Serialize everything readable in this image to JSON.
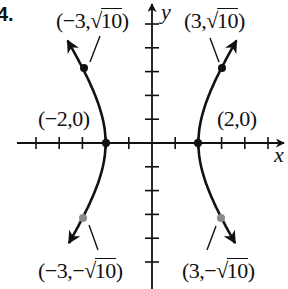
{
  "problem_number": "4.",
  "axes": {
    "x_label": "x",
    "y_label": "y"
  },
  "labels": {
    "upper_left": {
      "prefix": "(−3,",
      "radical": "√",
      "radicand": "10",
      "suffix": ")"
    },
    "upper_right": {
      "prefix": "(3,",
      "radical": "√",
      "radicand": "10",
      "suffix": ")"
    },
    "vertex_left": "(−2,0)",
    "vertex_right": "(2,0)",
    "lower_left": {
      "prefix": "(−3,−",
      "radical": "√",
      "radicand": "10",
      "suffix": ")"
    },
    "lower_right": {
      "prefix": "(3,−",
      "radical": "√",
      "radicand": "10",
      "suffix": ")"
    }
  },
  "colors": {
    "ink": "#111111",
    "gray_point": "#8a8a8a",
    "background": "#ffffff"
  },
  "chart_data": {
    "type": "line",
    "title": "",
    "equation": "x^2/4 - y^2/8 = 1",
    "curve": "hyperbola",
    "xlabel": "x",
    "ylabel": "y",
    "xlim": [
      -6.5,
      5.8
    ],
    "ylim": [
      -6,
      5.8
    ],
    "x_ticks": [
      -5,
      -4,
      -3,
      -2,
      -1,
      1,
      2,
      3,
      4,
      5
    ],
    "y_ticks": [
      -5,
      -4,
      -3,
      -2,
      -1,
      1,
      2,
      3,
      4,
      5
    ],
    "tick_labels_shown": false,
    "grid": false,
    "series": [
      {
        "name": "left branch",
        "direction": "arrows at both ends",
        "x_range": [
          -3.5,
          -2
        ]
      },
      {
        "name": "right branch",
        "direction": "arrows at both ends",
        "x_range": [
          2,
          3.5
        ]
      }
    ],
    "points": [
      {
        "label": "(−3,√10)",
        "x": -3,
        "y": 3.162,
        "style": "filled black"
      },
      {
        "label": "(3,√10)",
        "x": 3,
        "y": 3.162,
        "style": "filled black"
      },
      {
        "label": "(−2,0)",
        "x": -2,
        "y": 0,
        "style": "filled black"
      },
      {
        "label": "(2,0)",
        "x": 2,
        "y": 0,
        "style": "filled black"
      },
      {
        "label": "(−3,−√10)",
        "x": -3,
        "y": -3.162,
        "style": "filled gray"
      },
      {
        "label": "(3,−√10)",
        "x": 3,
        "y": -3.162,
        "style": "filled gray"
      }
    ]
  }
}
